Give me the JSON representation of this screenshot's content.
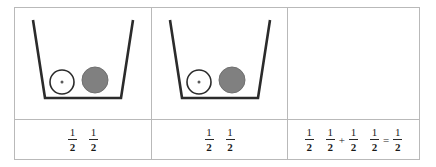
{
  "figure": {
    "type": "fraction-model-table",
    "columns": 3,
    "rows": 2,
    "colors": {
      "border": "#b9b9b9",
      "cup_stroke": "#2b2b2b",
      "token_filled": "#808080",
      "token_empty_fill": "#ffffff",
      "token_empty_stroke": "#2b2b2b",
      "text": "#1a1a1a",
      "background": "#ffffff"
    }
  },
  "cells": [
    {
      "id": "cell-1",
      "name": "first-addend-cup",
      "illustration": {
        "name": "cup-with-two-counters",
        "shape": "trapezoid-cup-open-top",
        "counters": [
          {
            "name": "counter-open",
            "style": "outlined",
            "fill": "#ffffff",
            "stroke": "#2b2b2b",
            "center_dot": true
          },
          {
            "name": "counter-filled",
            "style": "solid",
            "fill": "#808080",
            "stroke": "#6f6f6f",
            "center_dot": false
          }
        ]
      },
      "math": {
        "tokens": [
          {
            "kind": "fraction",
            "numerator": "1",
            "denominator": "2"
          },
          {
            "kind": "fraction",
            "numerator": "1",
            "denominator": "2"
          }
        ],
        "plain_text": "1/2  1/2"
      }
    },
    {
      "id": "cell-2",
      "name": "second-addend-cup",
      "illustration": {
        "name": "cup-with-two-counters",
        "shape": "trapezoid-cup-open-top",
        "counters": [
          {
            "name": "counter-open",
            "style": "outlined",
            "fill": "#ffffff",
            "stroke": "#2b2b2b",
            "center_dot": true
          },
          {
            "name": "counter-filled",
            "style": "solid",
            "fill": "#808080",
            "stroke": "#6f6f6f",
            "center_dot": false
          }
        ]
      },
      "math": {
        "tokens": [
          {
            "kind": "fraction",
            "numerator": "1",
            "denominator": "2"
          },
          {
            "kind": "fraction",
            "numerator": "1",
            "denominator": "2"
          }
        ],
        "plain_text": "1/2  1/2"
      }
    },
    {
      "id": "cell-3",
      "name": "sum-equation",
      "illustration": null,
      "math": {
        "tokens": [
          {
            "kind": "fraction",
            "numerator": "1",
            "denominator": "2"
          },
          {
            "kind": "fraction",
            "numerator": "1",
            "denominator": "2"
          },
          {
            "kind": "operator",
            "symbol": "+"
          },
          {
            "kind": "fraction",
            "numerator": "1",
            "denominator": "2"
          },
          {
            "kind": "fraction",
            "numerator": "1",
            "denominator": "2"
          },
          {
            "kind": "operator",
            "symbol": "="
          },
          {
            "kind": "fraction",
            "numerator": "1",
            "denominator": "2"
          }
        ],
        "plain_text": "1/2  1/2 + 1/2  1/2 = 1/2"
      }
    }
  ],
  "glyphs": {
    "one": "1",
    "two": "2",
    "plus": "+",
    "equals": "="
  }
}
